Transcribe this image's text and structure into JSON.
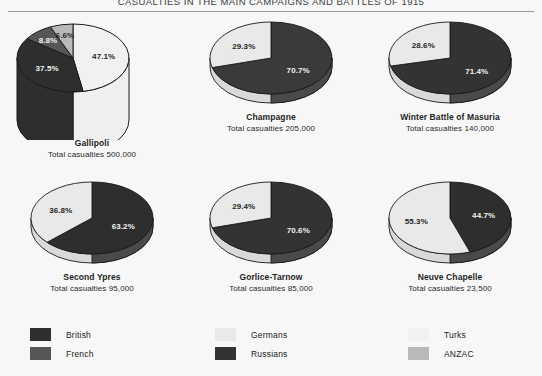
{
  "title": "CASUALTIES IN THE MAIN CAMPAIGNS AND BATTLES OF 1915",
  "colors": {
    "background": "#f7f7f7",
    "british": "#2e2e2e",
    "french": "#565656",
    "germans": "#e9e9e9",
    "russians": "#333333",
    "turks": "#f1f1f1",
    "anzac": "#b9b9b9",
    "outline": "#1a1a1a",
    "rule": "#9a9a9a"
  },
  "legend": {
    "columns": [
      [
        {
          "label": "British",
          "color": "#2e2e2e"
        },
        {
          "label": "French",
          "color": "#565656"
        }
      ],
      [
        {
          "label": "Germans",
          "color": "#e9e9e9"
        },
        {
          "label": "Russians",
          "color": "#333333"
        }
      ],
      [
        {
          "label": "Turks",
          "color": "#f1f1f1"
        },
        {
          "label": "ANZAC",
          "color": "#b9b9b9"
        }
      ]
    ]
  },
  "charts": [
    {
      "name": "Gallipoli",
      "total_label": "Total casualties 500,000",
      "total_value": 500000,
      "style": "cylinder",
      "slices": [
        {
          "label": "47.1%",
          "value": 47.1,
          "series": "Turks",
          "color": "#f1f1f1",
          "text": "dark"
        },
        {
          "label": "37.5%",
          "value": 37.5,
          "series": "British",
          "color": "#2e2e2e",
          "text": "light"
        },
        {
          "label": "8.8%",
          "value": 8.8,
          "series": "ANZAC",
          "color": "#565656",
          "text": "light"
        },
        {
          "label": "6.6%",
          "value": 6.6,
          "series": "French",
          "color": "#b9b9b9",
          "text": "dark"
        }
      ]
    },
    {
      "name": "Champagne",
      "total_label": "Total casualties 205,000",
      "total_value": 205000,
      "style": "disc",
      "slices": [
        {
          "label": "70.7%",
          "value": 70.7,
          "series": "French",
          "color": "#3a3a3a",
          "text": "light"
        },
        {
          "label": "29.3%",
          "value": 29.3,
          "series": "Germans",
          "color": "#e9e9e9",
          "text": "dark"
        }
      ]
    },
    {
      "name": "Winter Battle of Masuria",
      "total_label": "Total casualties 140,000",
      "total_value": 140000,
      "style": "disc",
      "slices": [
        {
          "label": "71.4%",
          "value": 71.4,
          "series": "Russians",
          "color": "#333333",
          "text": "light"
        },
        {
          "label": "28.6%",
          "value": 28.6,
          "series": "Germans",
          "color": "#e9e9e9",
          "text": "dark"
        }
      ]
    },
    {
      "name": "Second Ypres",
      "total_label": "Total casualties 95,000",
      "total_value": 95000,
      "style": "disc",
      "slices": [
        {
          "label": "63.2%",
          "value": 63.2,
          "series": "British",
          "color": "#2e2e2e",
          "text": "light"
        },
        {
          "label": "36.8%",
          "value": 36.8,
          "series": "Germans",
          "color": "#e9e9e9",
          "text": "dark"
        }
      ]
    },
    {
      "name": "Gorlice-Tarnow",
      "total_label": "Total casualties 85,000",
      "total_value": 85000,
      "style": "disc",
      "slices": [
        {
          "label": "70.6%",
          "value": 70.6,
          "series": "Russians",
          "color": "#333333",
          "text": "light"
        },
        {
          "label": "29.4%",
          "value": 29.4,
          "series": "Germans",
          "color": "#e9e9e9",
          "text": "dark"
        }
      ]
    },
    {
      "name": "Neuve Chapelle",
      "total_label": "Total casualties 23,500",
      "total_value": 23500,
      "style": "disc",
      "slices": [
        {
          "label": "44.7%",
          "value": 44.7,
          "series": "British",
          "color": "#2e2e2e",
          "text": "light"
        },
        {
          "label": "55.3%",
          "value": 55.3,
          "series": "Germans",
          "color": "#e9e9e9",
          "text": "dark"
        }
      ]
    }
  ],
  "chart_data": {
    "type": "pie",
    "title": "CASUALTIES IN THE MAIN CAMPAIGNS AND BATTLES OF 1915",
    "unit": "percent of total casualties",
    "legend_entries": [
      "British",
      "French",
      "Germans",
      "Russians",
      "Turks",
      "ANZAC"
    ],
    "legend_position": "bottom",
    "charts": [
      {
        "title": "Gallipoli",
        "subtitle": "Total casualties 500,000",
        "total": 500000,
        "categories": [
          "Turks",
          "British",
          "ANZAC",
          "French"
        ],
        "values": [
          47.1,
          37.5,
          8.8,
          6.6
        ]
      },
      {
        "title": "Champagne",
        "subtitle": "Total casualties 205,000",
        "total": 205000,
        "categories": [
          "French",
          "Germans"
        ],
        "values": [
          70.7,
          29.3
        ]
      },
      {
        "title": "Winter Battle of Masuria",
        "subtitle": "Total casualties 140,000",
        "total": 140000,
        "categories": [
          "Russians",
          "Germans"
        ],
        "values": [
          71.4,
          28.6
        ]
      },
      {
        "title": "Second Ypres",
        "subtitle": "Total casualties 95,000",
        "total": 95000,
        "categories": [
          "British",
          "Germans"
        ],
        "values": [
          63.2,
          36.8
        ]
      },
      {
        "title": "Gorlice-Tarnow",
        "subtitle": "Total casualties 85,000",
        "total": 85000,
        "categories": [
          "Russians",
          "Germans"
        ],
        "values": [
          70.6,
          29.4
        ]
      },
      {
        "title": "Neuve Chapelle",
        "subtitle": "Total casualties 23,500",
        "total": 23500,
        "categories": [
          "British",
          "Germans"
        ],
        "values": [
          44.7,
          55.3
        ]
      }
    ]
  }
}
